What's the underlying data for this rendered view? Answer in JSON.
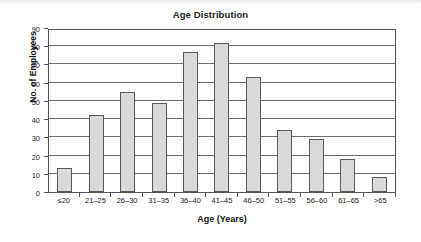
{
  "chart_data": {
    "type": "bar",
    "title": "Age Distribution",
    "xlabel": "Age (Years)",
    "ylabel": "No. of Employees",
    "categories": [
      "≤20",
      "21–25",
      "26–30",
      "31–35",
      "36–40",
      "41–45",
      "46–50",
      "51–55",
      "56–60",
      "61–65",
      ">65"
    ],
    "values": [
      13,
      42,
      55,
      49,
      77,
      82,
      63,
      34,
      29,
      18,
      8
    ],
    "ylim": [
      0,
      90
    ],
    "ytick_step": 10,
    "yticks": [
      90,
      80,
      70,
      60,
      50,
      40,
      30,
      20,
      10,
      0
    ],
    "ytick_labels": [
      "90",
      "80",
      "70",
      "60",
      "50",
      "40",
      "30",
      "20",
      "10",
      "0"
    ],
    "grid": "horizontal",
    "legend": "none",
    "bar_fill_color": "#d9d9d9",
    "bar_border_color": "#5a5a5a",
    "axis_color": "#555555",
    "gridline_color": "#6b6b6b",
    "background_color": "#ffffff"
  }
}
